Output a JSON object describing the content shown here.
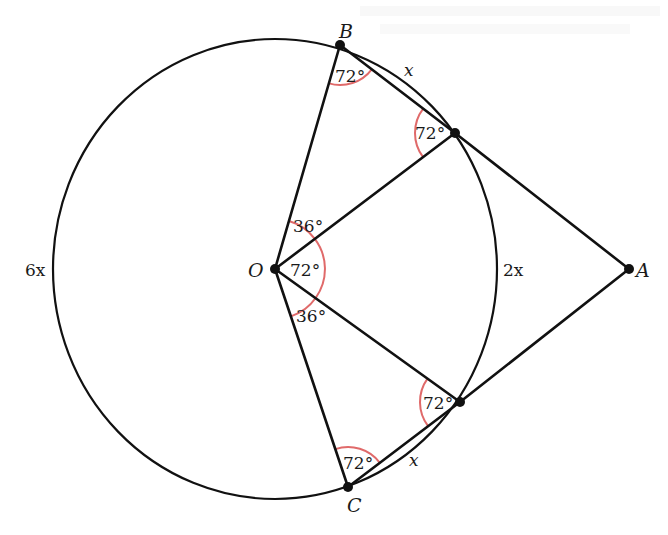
{
  "diagram": {
    "points": {
      "O": "O",
      "A": "A",
      "B": "B",
      "C": "C"
    },
    "arc_labels": {
      "major": "6x",
      "minor_between_tangents": "2x",
      "upper_small": "x",
      "lower_small": "x"
    },
    "angle_labels": {
      "at_B": "72°",
      "at_upper_tangent": "72°",
      "at_O_upper": "36°",
      "at_O_middle": "72°",
      "at_O_lower": "36°",
      "at_lower_tangent": "72°",
      "at_C": "72°"
    },
    "colors": {
      "line": "#111111",
      "angle_arc": "#e06a6a",
      "text": "#1a1a1a"
    }
  }
}
